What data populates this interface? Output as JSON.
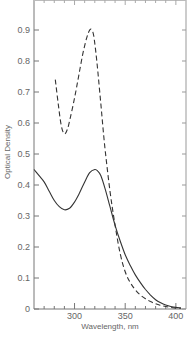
{
  "chart_data": {
    "type": "line",
    "title": "",
    "xlabel": "Wavelength, nm",
    "ylabel": "Optical Density",
    "xlim": [
      260,
      410
    ],
    "ylim": [
      0,
      1.0
    ],
    "x_ticks": [
      300,
      350,
      400
    ],
    "x_tick_labels": [
      "300",
      "350",
      "400"
    ],
    "y_ticks": [
      0,
      0.1,
      0.2,
      0.3,
      0.4,
      0.5,
      0.6,
      0.7,
      0.8,
      0.9
    ],
    "y_tick_labels": [
      "0",
      "0.1",
      "0.2",
      "0.3",
      "0.4",
      "0.5",
      "0.6",
      "0.7",
      "0.8",
      "0.9"
    ],
    "grid": false,
    "legend": null,
    "series": [
      {
        "name": "solid",
        "style": "solid",
        "x": [
          260,
          265,
          270,
          275,
          280,
          285,
          290,
          295,
          300,
          305,
          310,
          315,
          320,
          323,
          326,
          330,
          335,
          340,
          345,
          350,
          355,
          360,
          365,
          370,
          375,
          380,
          385,
          390,
          395,
          400,
          405
        ],
        "y": [
          0.45,
          0.43,
          0.41,
          0.38,
          0.35,
          0.33,
          0.32,
          0.325,
          0.345,
          0.375,
          0.41,
          0.44,
          0.45,
          0.445,
          0.43,
          0.39,
          0.33,
          0.27,
          0.22,
          0.175,
          0.14,
          0.11,
          0.085,
          0.063,
          0.045,
          0.03,
          0.02,
          0.013,
          0.008,
          0.005,
          0.004
        ]
      },
      {
        "name": "dashed",
        "style": "dashed",
        "x": [
          281,
          284,
          287,
          290,
          293,
          296,
          300,
          304,
          308,
          312,
          315,
          317,
          319,
          322,
          326,
          330,
          335,
          340,
          345,
          350,
          355,
          360,
          365,
          370,
          375,
          380,
          385,
          390,
          395,
          400,
          405
        ],
        "y": [
          0.74,
          0.66,
          0.59,
          0.565,
          0.58,
          0.62,
          0.68,
          0.75,
          0.82,
          0.875,
          0.9,
          0.9,
          0.88,
          0.8,
          0.66,
          0.52,
          0.38,
          0.27,
          0.18,
          0.12,
          0.085,
          0.062,
          0.045,
          0.033,
          0.024,
          0.017,
          0.012,
          0.008,
          0.005,
          0.003,
          0.002
        ]
      }
    ]
  },
  "axes": {
    "xlabel": "Wavelength, nm",
    "ylabel": "Optical Density"
  }
}
